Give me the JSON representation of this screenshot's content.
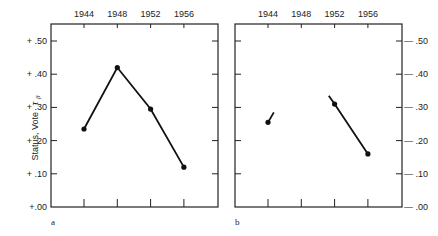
{
  "chart_data": [
    {
      "type": "line",
      "panel_label": "a",
      "title": "",
      "xlabel": "",
      "ylabel": "Status, Vote τβ",
      "x_tick_labels": [
        "1944",
        "1948",
        "1952",
        "1956"
      ],
      "y_tick_labels": [
        "+ .50",
        "+ .40",
        "+ .30",
        "+ .20",
        "+ .10",
        "+.00"
      ],
      "ylim": [
        0.0,
        0.55
      ],
      "grid": false,
      "legend": null,
      "series": [
        {
          "name": "Status, Vote",
          "segments": [
            {
              "x": [
                1944,
                1948,
                1952,
                1956
              ],
              "y": [
                0.235,
                0.42,
                0.295,
                0.12
              ],
              "markers": [
                true,
                true,
                true,
                true
              ]
            }
          ]
        }
      ]
    },
    {
      "type": "line",
      "panel_label": "b",
      "title": "",
      "xlabel": "",
      "ylabel": "",
      "x_tick_labels": [
        "1944",
        "1948",
        "1952",
        "1956"
      ],
      "y_tick_labels": [
        "— .50",
        "— .40",
        "— .30",
        "— .20",
        "— .10",
        "— .00"
      ],
      "ylim": [
        0.0,
        0.55
      ],
      "grid": false,
      "legend": null,
      "series": [
        {
          "name": "Status, Vote",
          "segments": [
            {
              "x": [
                1944,
                1944.7
              ],
              "y": [
                0.255,
                0.285
              ],
              "markers": [
                true,
                false
              ]
            },
            {
              "x": [
                1951.3,
                1952,
                1956
              ],
              "y": [
                0.335,
                0.31,
                0.16
              ],
              "markers": [
                false,
                true,
                true
              ]
            }
          ]
        }
      ]
    }
  ],
  "labels": {
    "panel_a": "a",
    "panel_b": "b",
    "ylabel_text": "Status, Vote",
    "ylabel_symbol": "τ",
    "ylabel_subscript": "β"
  }
}
